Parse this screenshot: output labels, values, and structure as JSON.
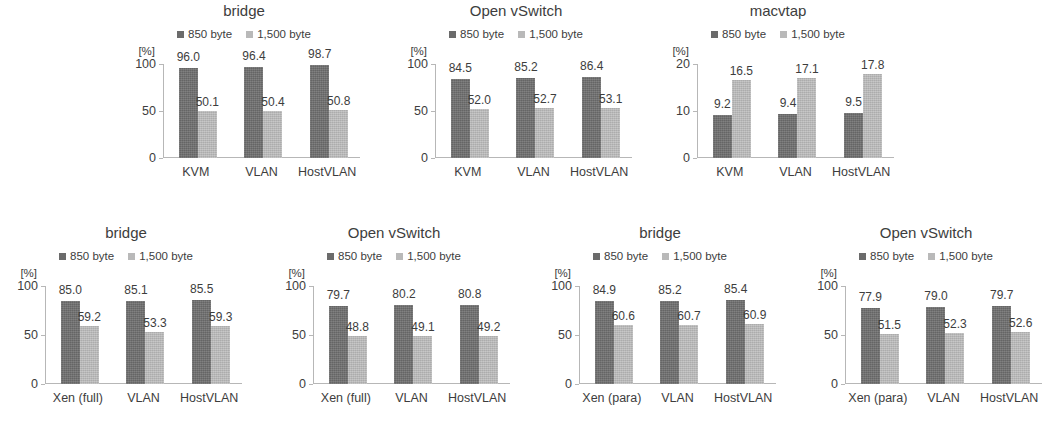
{
  "colors": {
    "series_850": "#6e6e6e",
    "series_1500": "#bcbcbc",
    "axis": "#b7b7b7",
    "text": "#3d3d3d",
    "background": "#ffffff"
  },
  "legend": {
    "series1_label": "850 byte",
    "series2_label": "1,500 byte"
  },
  "axis_unit": "[%]",
  "chart_data": [
    {
      "id": "kvm-bridge",
      "type": "bar",
      "title": "bridge",
      "xlabel": "",
      "ylabel": "[%]",
      "ylim": [
        0,
        100
      ],
      "yticks": [
        0,
        50,
        100
      ],
      "grid": false,
      "legend_position": "top-center",
      "categories": [
        "KVM",
        "VLAN",
        "HostVLAN"
      ],
      "series": [
        {
          "name": "850 byte",
          "values": [
            96.0,
            96.4,
            98.7
          ]
        },
        {
          "name": "1,500 byte",
          "values": [
            50.1,
            50.4,
            50.8
          ]
        }
      ]
    },
    {
      "id": "kvm-ovs",
      "type": "bar",
      "title": "Open vSwitch",
      "xlabel": "",
      "ylabel": "[%]",
      "ylim": [
        0,
        100
      ],
      "yticks": [
        0,
        50,
        100
      ],
      "grid": false,
      "legend_position": "top-center",
      "categories": [
        "KVM",
        "VLAN",
        "HostVLAN"
      ],
      "series": [
        {
          "name": "850 byte",
          "values": [
            84.5,
            85.2,
            86.4
          ]
        },
        {
          "name": "1,500 byte",
          "values": [
            52.0,
            52.7,
            53.1
          ]
        }
      ]
    },
    {
      "id": "kvm-macvtap",
      "type": "bar",
      "title": "macvtap",
      "xlabel": "",
      "ylabel": "[%]",
      "ylim": [
        0,
        20
      ],
      "yticks": [
        0,
        10,
        20
      ],
      "grid": false,
      "legend_position": "top-center",
      "categories": [
        "KVM",
        "VLAN",
        "HostVLAN"
      ],
      "series": [
        {
          "name": "850 byte",
          "values": [
            9.2,
            9.4,
            9.5
          ]
        },
        {
          "name": "1,500 byte",
          "values": [
            16.5,
            17.1,
            17.8
          ]
        }
      ]
    },
    {
      "id": "xenfull-bridge",
      "type": "bar",
      "title": "bridge",
      "xlabel": "",
      "ylabel": "[%]",
      "ylim": [
        0,
        100
      ],
      "yticks": [
        0,
        50,
        100
      ],
      "grid": false,
      "legend_position": "top-center",
      "categories": [
        "Xen (full)",
        "VLAN",
        "HostVLAN"
      ],
      "series": [
        {
          "name": "850 byte",
          "values": [
            85.0,
            85.1,
            85.5
          ]
        },
        {
          "name": "1,500 byte",
          "values": [
            59.2,
            53.3,
            59.3
          ]
        }
      ]
    },
    {
      "id": "xenfull-ovs",
      "type": "bar",
      "title": "Open vSwitch",
      "xlabel": "",
      "ylabel": "[%]",
      "ylim": [
        0,
        100
      ],
      "yticks": [
        0,
        50,
        100
      ],
      "grid": false,
      "legend_position": "top-center",
      "categories": [
        "Xen (full)",
        "VLAN",
        "HostVLAN"
      ],
      "series": [
        {
          "name": "850 byte",
          "values": [
            79.7,
            80.2,
            80.8
          ]
        },
        {
          "name": "1,500 byte",
          "values": [
            48.8,
            49.1,
            49.2
          ]
        }
      ]
    },
    {
      "id": "xenpara-bridge",
      "type": "bar",
      "title": "bridge",
      "xlabel": "",
      "ylabel": "[%]",
      "ylim": [
        0,
        100
      ],
      "yticks": [
        0,
        50,
        100
      ],
      "grid": false,
      "legend_position": "top-center",
      "categories": [
        "Xen (para)",
        "VLAN",
        "HostVLAN"
      ],
      "series": [
        {
          "name": "850 byte",
          "values": [
            84.9,
            85.2,
            85.4
          ]
        },
        {
          "name": "1,500 byte",
          "values": [
            60.6,
            60.7,
            60.9
          ]
        }
      ]
    },
    {
      "id": "xenpara-ovs",
      "type": "bar",
      "title": "Open vSwitch",
      "xlabel": "",
      "ylabel": "[%]",
      "ylim": [
        0,
        100
      ],
      "yticks": [
        0,
        50,
        100
      ],
      "grid": false,
      "legend_position": "top-center",
      "categories": [
        "Xen (para)",
        "VLAN",
        "HostVLAN"
      ],
      "series": [
        {
          "name": "850 byte",
          "values": [
            77.9,
            79.0,
            79.7
          ]
        },
        {
          "name": "1,500 byte",
          "values": [
            51.5,
            52.3,
            52.6
          ]
        }
      ]
    }
  ],
  "layout": [
    {
      "chart": 0,
      "left": 118,
      "top": 0,
      "width": 252,
      "height": 200
    },
    {
      "chart": 1,
      "left": 390,
      "top": 0,
      "width": 252,
      "height": 200
    },
    {
      "chart": 2,
      "left": 652,
      "top": 0,
      "width": 252,
      "height": 200
    },
    {
      "chart": 3,
      "left": 0,
      "top": 222,
      "width": 252,
      "height": 204
    },
    {
      "chart": 4,
      "left": 268,
      "top": 222,
      "width": 252,
      "height": 204
    },
    {
      "chart": 5,
      "left": 534,
      "top": 222,
      "width": 252,
      "height": 204
    },
    {
      "chart": 6,
      "left": 800,
      "top": 222,
      "width": 252,
      "height": 204
    }
  ]
}
